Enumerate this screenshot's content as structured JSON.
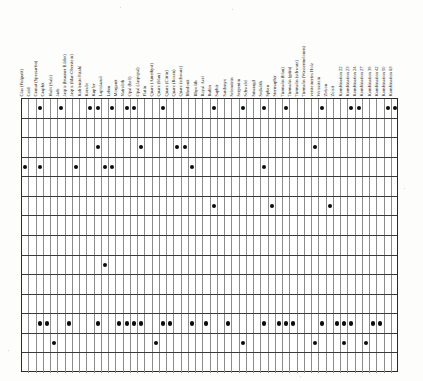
{
  "document": {
    "title": "Mineral- und Edelstein-Matrix",
    "type": "incidence-matrix",
    "orientation": "column labels rotated 90 degrees counter-clockwise",
    "columns_count": 49,
    "rows_count": 14,
    "dot_color": "#0b0b0b",
    "grid_line_color": "#8c8c8c",
    "row_line_color": "#3a3a3a",
    "border_color": "#2a2a2a",
    "background_color": "#ffffff"
  },
  "columns": [
    "Glas (Fulgurit)",
    "Gold",
    "Granat (Spessartin)",
    "Graphit",
    "Halit (Salz)",
    "Jade",
    "Jaspis (brauner Bilder)",
    "Jaspis (Idar-Oberstein)",
    "Kohlenstoffstahl",
    "Koralle",
    "Kupfer",
    "Lapislazuli",
    "Lehm",
    "Morganit",
    "Natrolith",
    "Opal (hell)",
    "Opal (Jaspopal)",
    "Platin",
    "Quarz (Amethyst)",
    "Quarz (blau)",
    "Quarz (Citrin)",
    "Quarz (Rosen)",
    "Quarz (schwarz)",
    "Rhodonit",
    "Rhyolith",
    "Royal Azel",
    "Rubin",
    "Saphir",
    "Sardonyx",
    "Selenstein",
    "Serpentin",
    "Schwefel",
    "Smaragd",
    "Sodalith",
    "Sphen",
    "Sternsaphir",
    "Turmalin (blau)",
    "Turmalin (grün)",
    "Turmalin (schwarz)",
    "Turmalin (Wassermelonen)",
    "versteinertes Holz",
    "Weissstein",
    "Zirkon",
    "Zoisit",
    "Kombination 22",
    "Kombination 23",
    "Kombination 24",
    "Kombination 27",
    "Kombination 39",
    "Kombination 42",
    "Kombination 50",
    "Kombination 63"
  ],
  "chart_data": {
    "type": "heatmap",
    "xlabel": "",
    "ylabel": "",
    "legend": [],
    "categories": [
      "Glas (Fulgurit)",
      "Gold",
      "Granat (Spessartin)",
      "Graphit",
      "Halit (Salz)",
      "Jade",
      "Jaspis (brauner Bilder)",
      "Jaspis (Idar-Oberstein)",
      "Kohlenstoffstahl",
      "Koralle",
      "Kupfer",
      "Lapislazuli",
      "Lehm",
      "Morganit",
      "Natrolith",
      "Opal (hell)",
      "Opal (Jaspopal)",
      "Platin",
      "Quarz (Amethyst)",
      "Quarz (blau)",
      "Quarz (Citrin)",
      "Quarz (Rosen)",
      "Quarz (schwarz)",
      "Rhodonit",
      "Rhyolith",
      "Royal Azel",
      "Rubin",
      "Saphir",
      "Sardonyx",
      "Selenstein",
      "Serpentin",
      "Schwefel",
      "Smaragd",
      "Sodalith",
      "Sphen",
      "Sternsaphir",
      "Turmalin (blau)",
      "Turmalin (grün)",
      "Turmalin (schwarz)",
      "Turmalin (Wassermelonen)",
      "versteinertes Holz",
      "Weissstein",
      "Zirkon",
      "Zoisit",
      "Kombination 22",
      "Kombination 23",
      "Kombination 24",
      "Kombination 27",
      "Kombination 39",
      "Kombination 42",
      "Kombination 50",
      "Kombination 63"
    ],
    "rows": [
      "1",
      "2",
      "3",
      "4",
      "5",
      "6",
      "7",
      "8",
      "9",
      "10",
      "11",
      "12",
      "13",
      "14"
    ],
    "marks": [
      [
        2,
        5,
        9,
        10,
        12,
        14,
        15,
        19,
        26,
        30,
        33,
        36,
        41,
        45,
        46,
        50,
        51
      ],
      [],
      [
        10,
        16,
        21,
        22,
        40
      ],
      [
        0,
        2,
        7,
        11,
        12,
        23,
        33
      ],
      [],
      [
        26,
        34,
        42
      ],
      [],
      [],
      [
        11
      ],
      [],
      [],
      [
        2,
        3,
        6,
        10,
        13,
        14,
        15,
        16,
        19,
        20,
        23,
        25,
        28,
        33,
        35,
        36,
        37,
        41,
        43,
        44,
        45,
        48,
        49
      ],
      [
        4,
        18,
        30,
        40,
        44,
        47
      ],
      [],
      [
        0,
        1,
        5,
        6,
        7,
        8,
        11,
        13,
        14,
        17,
        18,
        19,
        29,
        35,
        39,
        51
      ]
    ]
  }
}
